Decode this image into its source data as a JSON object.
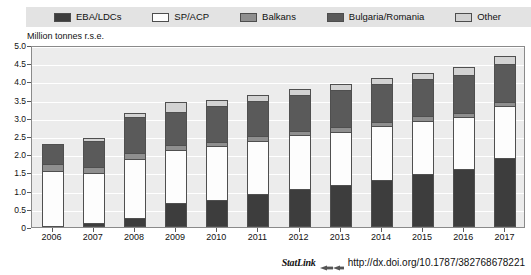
{
  "figure": {
    "title_partial": "",
    "axis_title": "Million tonnes r.s.e.",
    "statlink_word": "StatLink",
    "statlink_glyph": "statlink-arrow-icon",
    "statlink_url": "http://dx.doi.org/10.1787/382768678221"
  },
  "legend": {
    "items": [
      {
        "label": "EBA/LDCs",
        "color": "#3d3d3d"
      },
      {
        "label": "SP/ACP",
        "color": "#fdfdfd"
      },
      {
        "label": "Balkans",
        "color": "#8f8f8f"
      },
      {
        "label": "Bulgaria/Romania",
        "color": "#5a5a5a"
      },
      {
        "label": "Other",
        "color": "#d2d2d2"
      }
    ]
  },
  "chart_data": {
    "type": "bar",
    "stacked": true,
    "title": "Million tonnes r.s.e.",
    "xlabel": "",
    "ylabel": "Million tonnes r.s.e.",
    "ylim": [
      0,
      5.0
    ],
    "ytick_step": 0.5,
    "yticks": [
      "0",
      "0.5",
      "1.0",
      "1.5",
      "2.0",
      "2.5",
      "3.0",
      "3.5",
      "4.0",
      "4.5",
      "5.0"
    ],
    "grid": true,
    "legend_position": "top",
    "categories": [
      "2006",
      "2007",
      "2008",
      "2009",
      "2010",
      "2011",
      "2012",
      "2013",
      "2014",
      "2015",
      "2016",
      "2017"
    ],
    "series": [
      {
        "name": "EBA/LDCs",
        "color": "#3d3d3d",
        "values": [
          0.0,
          0.1,
          0.25,
          0.65,
          0.75,
          0.9,
          1.05,
          1.15,
          1.3,
          1.45,
          1.6,
          1.9
        ]
      },
      {
        "name": "SP/ACP",
        "color": "#fdfdfd",
        "values": [
          1.55,
          1.4,
          1.65,
          1.5,
          1.5,
          1.5,
          1.5,
          1.5,
          1.5,
          1.5,
          1.45,
          1.45
        ]
      },
      {
        "name": "Balkans",
        "color": "#8f8f8f",
        "values": [
          0.2,
          0.2,
          0.2,
          0.15,
          0.15,
          0.15,
          0.15,
          0.15,
          0.15,
          0.15,
          0.15,
          0.15
        ]
      },
      {
        "name": "Bulgaria/Romania",
        "color": "#5a5a5a",
        "values": [
          0.6,
          0.75,
          1.0,
          0.95,
          1.0,
          1.0,
          1.0,
          1.05,
          1.05,
          1.05,
          1.05,
          1.05
        ]
      },
      {
        "name": "Other",
        "color": "#d2d2d2",
        "values": [
          0.0,
          0.1,
          0.15,
          0.3,
          0.2,
          0.2,
          0.2,
          0.2,
          0.2,
          0.2,
          0.25,
          0.25
        ]
      }
    ],
    "totals": [
      2.35,
      2.55,
      3.25,
      3.55,
      3.6,
      3.75,
      3.9,
      4.05,
      4.2,
      4.35,
      4.5,
      4.8
    ]
  }
}
